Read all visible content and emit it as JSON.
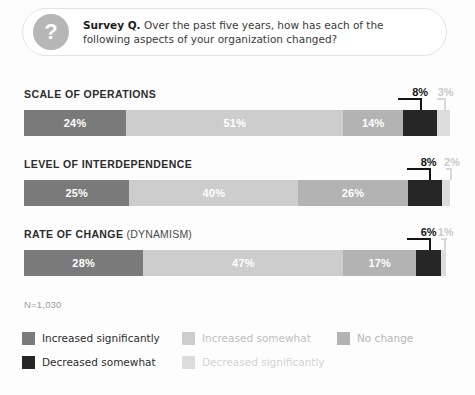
{
  "survey": {
    "icon": "question-mark-icon",
    "lead": "Survey Q.",
    "question": " Over the past five years, how has each of the following aspects of your organization changed?"
  },
  "footnote": "N=1,030",
  "legend": {
    "rows": [
      [
        {
          "label": "Increased significantly",
          "color": "#7a7a7a",
          "text_color": "#2c2c2c"
        },
        {
          "label": "Increased somewhat",
          "color": "#cdcdcd",
          "text_color": "#bdbdbd"
        },
        {
          "label": "No change",
          "color": "#b3b3b3",
          "text_color": "#b5b5b5"
        }
      ],
      [
        {
          "label": "Decreased somewhat",
          "color": "#262626",
          "text_color": "#2c2c2c"
        },
        {
          "label": "Decreased significantly",
          "color": "#dcdcdc",
          "text_color": "#d2d2d2"
        }
      ]
    ]
  },
  "chart_data": {
    "type": "bar",
    "orientation": "horizontal",
    "stacked": true,
    "normalized_percent": true,
    "title": "Survey Q. Over the past five years, how has each of the following aspects of your organization changed?",
    "xlabel": "",
    "ylabel": "",
    "xlim": [
      0,
      100
    ],
    "grid": false,
    "legend_position": "bottom",
    "sample_size": "N=1,030",
    "categories": [
      "SCALE OF OPERATIONS",
      "LEVEL OF INTERDEPENDENCE",
      "RATE OF CHANGE (DYNAMISM)"
    ],
    "series": [
      {
        "name": "Increased significantly",
        "color": "#7a7a7a",
        "values": [
          24,
          25,
          28
        ]
      },
      {
        "name": "Increased somewhat",
        "color": "#cdcdcd",
        "values": [
          51,
          40,
          47
        ]
      },
      {
        "name": "No change",
        "color": "#b3b3b3",
        "values": [
          14,
          26,
          17
        ]
      },
      {
        "name": "Decreased somewhat",
        "color": "#262626",
        "values": [
          8,
          8,
          6
        ]
      },
      {
        "name": "Decreased significantly",
        "color": "#dcdcdc",
        "values": [
          3,
          2,
          1
        ]
      }
    ],
    "bars": [
      {
        "title_main": "SCALE OF OPERATIONS",
        "title_sub": "",
        "segments": [
          {
            "name": "Increased significantly",
            "value": 24,
            "label": "24%",
            "color": "#7a7a7a",
            "label_style": "inside"
          },
          {
            "name": "Increased somewhat",
            "value": 51,
            "label": "51%",
            "color": "#cdcdcd",
            "label_style": "inside"
          },
          {
            "name": "No change",
            "value": 14,
            "label": "14%",
            "color": "#b3b3b3",
            "label_style": "inside"
          },
          {
            "name": "Decreased somewhat",
            "value": 8,
            "label": "8%",
            "color": "#262626",
            "label_style": "callout-dark"
          },
          {
            "name": "Decreased significantly",
            "value": 3,
            "label": "3%",
            "color": "#dcdcdc",
            "label_style": "callout-light"
          }
        ]
      },
      {
        "title_main": "LEVEL OF INTERDEPENDENCE",
        "title_sub": "",
        "segments": [
          {
            "name": "Increased significantly",
            "value": 25,
            "label": "25%",
            "color": "#7a7a7a",
            "label_style": "inside"
          },
          {
            "name": "Increased somewhat",
            "value": 40,
            "label": "40%",
            "color": "#cdcdcd",
            "label_style": "inside"
          },
          {
            "name": "No change",
            "value": 26,
            "label": "26%",
            "color": "#b3b3b3",
            "label_style": "inside"
          },
          {
            "name": "Decreased somewhat",
            "value": 8,
            "label": "8%",
            "color": "#262626",
            "label_style": "callout-dark"
          },
          {
            "name": "Decreased significantly",
            "value": 2,
            "label": "2%",
            "color": "#dcdcdc",
            "label_style": "callout-light"
          }
        ]
      },
      {
        "title_main": "RATE OF CHANGE",
        "title_sub": " (DYNAMISM)",
        "segments": [
          {
            "name": "Increased significantly",
            "value": 28,
            "label": "28%",
            "color": "#7a7a7a",
            "label_style": "inside"
          },
          {
            "name": "Increased somewhat",
            "value": 47,
            "label": "47%",
            "color": "#cdcdcd",
            "label_style": "inside"
          },
          {
            "name": "No change",
            "value": 17,
            "label": "17%",
            "color": "#b3b3b3",
            "label_style": "inside"
          },
          {
            "name": "Decreased somewhat",
            "value": 6,
            "label": "6%",
            "color": "#262626",
            "label_style": "callout-dark"
          },
          {
            "name": "Decreased significantly",
            "value": 1,
            "label": "1%",
            "color": "#dcdcdc",
            "label_style": "callout-light"
          }
        ]
      }
    ]
  }
}
